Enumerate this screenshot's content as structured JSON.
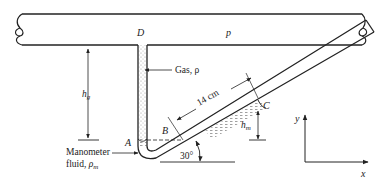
{
  "figure": {
    "type": "inclined-manometer-schematic",
    "pipe": {
      "label_point": "D",
      "label_pressure": "p"
    },
    "gas_label": "Gas, ρ",
    "points": {
      "A": "A",
      "B": "B",
      "C": "C"
    },
    "dimensions": {
      "h_gas": {
        "symbol": "h",
        "subscript": "g"
      },
      "h_manometer": {
        "symbol": "h",
        "subscript": "m"
      },
      "incline_length": "14 cm",
      "incline_angle": "30°"
    },
    "manometer_fluid_label": {
      "line1": "Manometer",
      "line2_prefix": "fluid, ",
      "line2_symbol": "ρ",
      "line2_subscript": "m"
    },
    "axes": {
      "y": "y",
      "x": "x"
    },
    "colors": {
      "line": "#222222",
      "fluid_hatch": "#888888",
      "background": "#ffffff"
    }
  }
}
